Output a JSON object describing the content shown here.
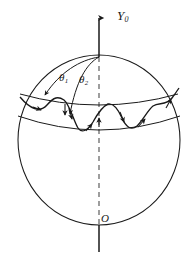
{
  "figure": {
    "labels": {
      "y_axis": "Y",
      "y_axis_sub": "0",
      "theta1": "θ",
      "theta1_sub": "1",
      "theta2": "θ",
      "theta2_sub": "2",
      "origin": "O"
    },
    "colors": {
      "stroke": "#1a1a1a",
      "background": "#ffffff",
      "dashed_axis": "#6f6f6f"
    },
    "geometry": {
      "sphere_center_x": 99,
      "sphere_center_y": 140,
      "sphere_radius_x": 81,
      "sphere_radius_y": 85,
      "pole_x": 99,
      "pole_y": 57,
      "axis_top_y": 15,
      "axis_bottom_y": 252,
      "latitude_upper_y": 95,
      "latitude_lower_y": 122,
      "wave_cycles": 3
    }
  }
}
